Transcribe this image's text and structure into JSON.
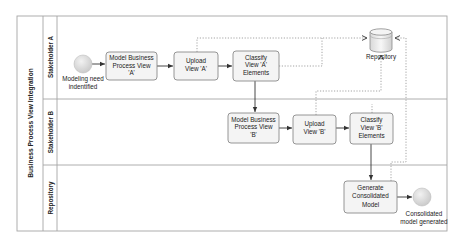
{
  "pool": {
    "title": "Business Process View Integration",
    "lanes": [
      {
        "id": "lane-a",
        "label": "Stakeholder A"
      },
      {
        "id": "lane-b",
        "label": "Stakeholder B"
      },
      {
        "id": "lane-repo",
        "label": "Repository"
      }
    ]
  },
  "events": {
    "start": {
      "label_line1": "Modeling need",
      "label_line2": "indentified"
    },
    "end": {
      "label_line1": "Consolidated",
      "label_line2": "model generated"
    }
  },
  "tasks": {
    "model_a": {
      "line1": "Model Business",
      "line2": "Process View",
      "line3": "'A'"
    },
    "upload_a": {
      "line1": "Upload",
      "line2": "View 'A'"
    },
    "classify_a": {
      "line1": "Classify",
      "line2": "View 'A'",
      "line3": "Elements"
    },
    "model_b": {
      "line1": "Model Business",
      "line2": "Process View",
      "line3": "'B'"
    },
    "upload_b": {
      "line1": "Upload",
      "line2": "View 'B'"
    },
    "classify_b": {
      "line1": "Classify",
      "line2": "View 'B'",
      "line3": "Elements"
    },
    "generate": {
      "line1": "Generate",
      "line2": "Consolidated",
      "line3": "Model"
    }
  },
  "data_store": {
    "label": "Repository"
  },
  "colors": {
    "task_fill": "#f4f4f4",
    "task_stroke": "#8a8a8a",
    "event_fill": "#d9d9d9",
    "lane_line": "#a5a5a5"
  }
}
